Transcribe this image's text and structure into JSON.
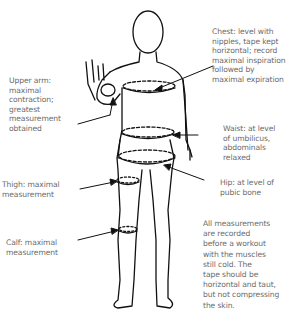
{
  "labels": {
    "chest": "Chest: level with\nnipples, tape kept\nhorizontal; record\nmaximal inspiration\nfollowed by\nmaximal expiration",
    "upper_arm": "Upper arm:\nmaximal\ncontraction;\ngreatest\nmeasurement\nobtained",
    "waist": "Waist: at level\nof umbilicus,\nabdominals\nrelaxed",
    "hip": "Hip: at level of\npubic bone",
    "thigh": "Thigh: maximal\nmeasurement",
    "calf": "Calf: maximal\nmeasurement",
    "note": "All measurements\nare recorded\nbefore a workout\nwith the muscles\nstill cold. The\ntape should be\nhorizontal and taut,\nbut not compressing\nthe skin."
  },
  "colors": {
    "text": "#6b6b6b",
    "line": "#111111"
  }
}
